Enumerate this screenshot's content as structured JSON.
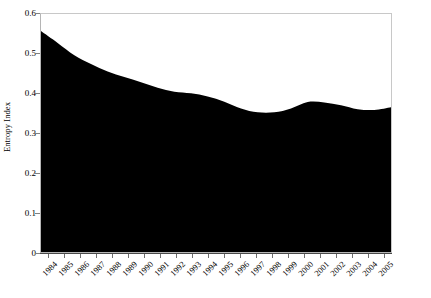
{
  "chart_data": {
    "type": "area",
    "title": "",
    "xlabel": "",
    "ylabel": "Entropy Index",
    "xlim": [
      1984,
      2005
    ],
    "ylim": [
      0,
      0.6
    ],
    "grid": false,
    "legend": "none",
    "series_color": "#000000",
    "categories": [
      "1984",
      "1985",
      "1986",
      "1987",
      "1988",
      "1989",
      "1990",
      "1991",
      "1992",
      "1993",
      "1994",
      "1995",
      "1996",
      "1997",
      "1998",
      "1999",
      "2000",
      "2001",
      "2002",
      "2003",
      "2004",
      "2005"
    ],
    "values": [
      0.557,
      0.527,
      0.496,
      0.474,
      0.455,
      0.441,
      0.428,
      0.414,
      0.404,
      0.4,
      0.392,
      0.379,
      0.362,
      0.352,
      0.352,
      0.362,
      0.378,
      0.377,
      0.37,
      0.36,
      0.358,
      0.365
    ],
    "ytick_labels": [
      "0",
      "0.1",
      "0.2",
      "0.3",
      "0.4",
      "0.5",
      "0.6"
    ],
    "ytick_values": [
      0,
      0.1,
      0.2,
      0.3,
      0.4,
      0.5,
      0.6
    ]
  }
}
